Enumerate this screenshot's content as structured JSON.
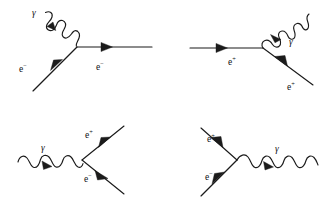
{
  "figure": {
    "background_color": "#ffffff",
    "ink_color": "#1b1b1b",
    "width": 334,
    "height": 207,
    "panel_count": 4
  },
  "panels": [
    {
      "id": "panel-top-left",
      "name": "electron-emits-absorbs-photon",
      "vertex": {
        "x": 77,
        "y": 47
      },
      "labels": [
        {
          "name": "photon-label",
          "text": "γ",
          "base": "γ",
          "sup": "",
          "x": 32,
          "y": 16
        },
        {
          "name": "incoming-electron-label",
          "text": "e−",
          "base": "e",
          "sup": "−",
          "x": 19,
          "y": 72
        },
        {
          "name": "outgoing-electron-label",
          "text": "e−",
          "base": "e",
          "sup": "−",
          "x": 96,
          "y": 70
        }
      ],
      "lines": [
        {
          "name": "photon-wavy-line",
          "kind": "photon",
          "from": {
            "x": 44,
            "y": 13
          },
          "to": {
            "x": 77,
            "y": 47
          },
          "arrow_at": 0.42,
          "arrow_dir": "down-left"
        },
        {
          "name": "incoming-electron-line",
          "kind": "fermion",
          "from": {
            "x": 33,
            "y": 91
          },
          "to": {
            "x": 77,
            "y": 47
          },
          "arrow_at": 0.55,
          "arrow_dir": "up-right"
        },
        {
          "name": "outgoing-electron-line",
          "kind": "fermion",
          "from": {
            "x": 77,
            "y": 47
          },
          "to": {
            "x": 152,
            "y": 47
          },
          "arrow_at": 0.38,
          "arrow_dir": "right"
        }
      ]
    },
    {
      "id": "panel-top-right",
      "name": "positron-emits-photon",
      "vertex": {
        "x": 263,
        "y": 48
      },
      "labels": [
        {
          "name": "photon-label",
          "text": "γ",
          "base": "γ",
          "sup": "",
          "x": 289,
          "y": 45
        },
        {
          "name": "incoming-positron-label",
          "text": "e+",
          "base": "e",
          "sup": "+",
          "x": 228,
          "y": 65
        },
        {
          "name": "outgoing-positron-label",
          "text": "e+",
          "base": "e",
          "sup": "+",
          "x": 287,
          "y": 90
        }
      ],
      "lines": [
        {
          "name": "incoming-positron-line",
          "kind": "fermion",
          "from": {
            "x": 190,
            "y": 48
          },
          "to": {
            "x": 263,
            "y": 48
          },
          "arrow_at": 0.48,
          "arrow_dir": "right"
        },
        {
          "name": "photon-wavy-line",
          "kind": "photon",
          "from": {
            "x": 263,
            "y": 48
          },
          "to": {
            "x": 298,
            "y": 10
          },
          "arrow_at": 0.4,
          "arrow_dir": "up-left"
        },
        {
          "name": "outgoing-positron-line",
          "kind": "fermion",
          "from": {
            "x": 263,
            "y": 48
          },
          "to": {
            "x": 313,
            "y": 85
          },
          "arrow_at": 0.33,
          "arrow_dir": "down-right"
        }
      ]
    },
    {
      "id": "panel-bottom-left",
      "name": "photon-pair-production",
      "vertex": {
        "x": 82,
        "y": 160
      },
      "labels": [
        {
          "name": "photon-label",
          "text": "γ",
          "base": "γ",
          "sup": "",
          "x": 41,
          "y": 151
        },
        {
          "name": "outgoing-positron-label",
          "text": "e+",
          "base": "e",
          "sup": "+",
          "x": 85,
          "y": 138
        },
        {
          "name": "outgoing-electron-label",
          "text": "e−",
          "base": "e",
          "sup": "−",
          "x": 84,
          "y": 182
        }
      ],
      "lines": [
        {
          "name": "photon-wavy-line",
          "kind": "photon",
          "from": {
            "x": 18,
            "y": 160
          },
          "to": {
            "x": 82,
            "y": 160
          },
          "arrow_at": 0.47,
          "arrow_dir": "right-down"
        },
        {
          "name": "outgoing-positron-line",
          "kind": "fermion",
          "from": {
            "x": 82,
            "y": 160
          },
          "to": {
            "x": 123,
            "y": 127
          },
          "arrow_at": 0.55,
          "arrow_dir": "up-right"
        },
        {
          "name": "outgoing-electron-line",
          "kind": "fermion",
          "from": {
            "x": 123,
            "y": 193
          },
          "to": {
            "x": 82,
            "y": 160
          },
          "arrow_at": 0.42,
          "arrow_dir": "up-left"
        }
      ]
    },
    {
      "id": "panel-bottom-right",
      "name": "pair-annihilation-to-photon",
      "vertex": {
        "x": 237,
        "y": 160
      },
      "labels": [
        {
          "name": "photon-label",
          "text": "γ",
          "base": "γ",
          "sup": "",
          "x": 275,
          "y": 152
        },
        {
          "name": "incoming-positron-label",
          "text": "e+",
          "base": "e",
          "sup": "+",
          "x": 207,
          "y": 142
        },
        {
          "name": "incoming-electron-label",
          "text": "e−",
          "base": "e",
          "sup": "−",
          "x": 205,
          "y": 180
        }
      ],
      "lines": [
        {
          "name": "incoming-positron-line",
          "kind": "fermion",
          "from": {
            "x": 201,
            "y": 128
          },
          "to": {
            "x": 237,
            "y": 160
          },
          "arrow_at": 0.52,
          "arrow_dir": "down-right"
        },
        {
          "name": "incoming-electron-line",
          "kind": "fermion",
          "from": {
            "x": 201,
            "y": 196
          },
          "to": {
            "x": 237,
            "y": 160
          },
          "arrow_at": 0.55,
          "arrow_dir": "up-right"
        },
        {
          "name": "photon-wavy-line",
          "kind": "photon",
          "from": {
            "x": 237,
            "y": 160
          },
          "to": {
            "x": 318,
            "y": 160
          },
          "arrow_at": 0.47,
          "arrow_dir": "right-down"
        }
      ]
    }
  ]
}
